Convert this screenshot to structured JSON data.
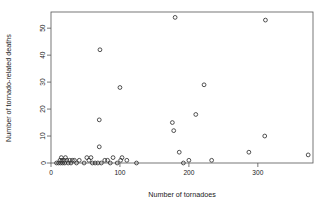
{
  "chart_data": {
    "type": "scatter",
    "title": "",
    "subtitle": "",
    "xlabel": "Number of tornadoes",
    "ylabel": "Number of tornado-related deaths",
    "xlim": [
      0,
      380
    ],
    "ylim": [
      0,
      56
    ],
    "xticks": [
      0,
      100,
      200,
      300
    ],
    "yticks": [
      0,
      10,
      20,
      30,
      40,
      50
    ],
    "xtick_labels": [
      "0",
      "100",
      "200",
      "300"
    ],
    "ytick_labels": [
      "0",
      "10",
      "20",
      "30",
      "40",
      "50"
    ],
    "grid": false,
    "legend": false,
    "legend_position": "none",
    "marker": "open-circle",
    "marker_color": "#333333",
    "points": [
      {
        "x": 8,
        "y": 0
      },
      {
        "x": 11,
        "y": 0
      },
      {
        "x": 13,
        "y": 1
      },
      {
        "x": 14,
        "y": 0
      },
      {
        "x": 15,
        "y": 2
      },
      {
        "x": 16,
        "y": 1
      },
      {
        "x": 17,
        "y": 0
      },
      {
        "x": 19,
        "y": 1
      },
      {
        "x": 20,
        "y": 0
      },
      {
        "x": 21,
        "y": 2
      },
      {
        "x": 23,
        "y": 1
      },
      {
        "x": 25,
        "y": 0
      },
      {
        "x": 27,
        "y": 1
      },
      {
        "x": 29,
        "y": 0
      },
      {
        "x": 31,
        "y": 1
      },
      {
        "x": 34,
        "y": 1
      },
      {
        "x": 37,
        "y": 0
      },
      {
        "x": 41,
        "y": 1
      },
      {
        "x": 48,
        "y": 0
      },
      {
        "x": 52,
        "y": 2
      },
      {
        "x": 55,
        "y": 1
      },
      {
        "x": 58,
        "y": 2
      },
      {
        "x": 60,
        "y": 0
      },
      {
        "x": 64,
        "y": 0
      },
      {
        "x": 68,
        "y": 0
      },
      {
        "x": 70,
        "y": 6
      },
      {
        "x": 70,
        "y": 16
      },
      {
        "x": 71,
        "y": 42
      },
      {
        "x": 73,
        "y": 0
      },
      {
        "x": 78,
        "y": 1
      },
      {
        "x": 82,
        "y": 1
      },
      {
        "x": 86,
        "y": 0
      },
      {
        "x": 90,
        "y": 2
      },
      {
        "x": 96,
        "y": 0
      },
      {
        "x": 100,
        "y": 28
      },
      {
        "x": 101,
        "y": 1
      },
      {
        "x": 103,
        "y": 2
      },
      {
        "x": 110,
        "y": 1
      },
      {
        "x": 124,
        "y": 0
      },
      {
        "x": 176,
        "y": 15
      },
      {
        "x": 178,
        "y": 12
      },
      {
        "x": 180,
        "y": 54
      },
      {
        "x": 186,
        "y": 4
      },
      {
        "x": 192,
        "y": 0
      },
      {
        "x": 200,
        "y": 1
      },
      {
        "x": 210,
        "y": 18
      },
      {
        "x": 222,
        "y": 29
      },
      {
        "x": 233,
        "y": 1
      },
      {
        "x": 287,
        "y": 4
      },
      {
        "x": 310,
        "y": 10
      },
      {
        "x": 311,
        "y": 53
      },
      {
        "x": 373,
        "y": 3
      }
    ]
  }
}
